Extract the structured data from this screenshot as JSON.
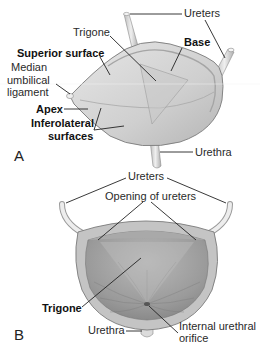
{
  "figure": {
    "colors": {
      "tissue_light": "#d8d8d8",
      "tissue_mid": "#b9b9b9",
      "tissue_dark": "#8e8e8e",
      "outline": "#7a7a7a",
      "label_text": "#2a2a2a",
      "leader_line": "#222222",
      "background": "#ffffff"
    }
  },
  "panel_a": {
    "letter": "A",
    "labels": {
      "ureters": "Ureters",
      "trigone": "Trigone",
      "base": "Base",
      "superior_surface": "Superior surface",
      "median_line1": "Median",
      "median_line2": "umbilical",
      "median_line3": "ligament",
      "apex": "Apex",
      "inferolateral_line1": "Inferolateral",
      "inferolateral_line2": "surfaces",
      "urethra": "Urethra"
    }
  },
  "panel_b": {
    "letter": "B",
    "labels": {
      "ureters": "Ureters",
      "opening_of_ureters": "Opening of ureters",
      "trigone": "Trigone",
      "urethra": "Urethra",
      "internal_line1": "Internal urethral",
      "internal_line2": "orifice"
    }
  }
}
